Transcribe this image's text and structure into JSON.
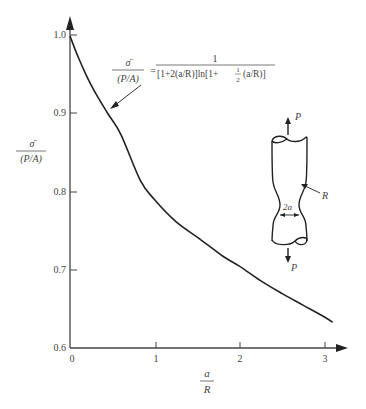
{
  "chart_data": {
    "type": "line",
    "title": "",
    "xlabel": "a/R",
    "ylabel": "σ̄/(P/A)",
    "xlim": [
      0,
      3.2
    ],
    "ylim": [
      0.6,
      1.05
    ],
    "grid": false,
    "x_ticks": [
      "0",
      "1",
      "2",
      "3"
    ],
    "y_ticks": [
      "0.6",
      "0.7",
      "0.8",
      "0.9",
      "1.0"
    ],
    "series": [
      {
        "name": "σ̄/(P/A)",
        "x": [
          0,
          0.1,
          0.2,
          0.3,
          0.45,
          0.6,
          0.83,
          1.0,
          1.25,
          1.53,
          1.8,
          2.0,
          2.24,
          2.5,
          2.75,
          3.0,
          3.1
        ],
        "y": [
          1.0,
          0.972,
          0.948,
          0.927,
          0.9,
          0.874,
          0.815,
          0.79,
          0.762,
          0.74,
          0.718,
          0.705,
          0.687,
          0.67,
          0.655,
          0.64,
          0.633
        ]
      }
    ],
    "annotations": {
      "formula_lhs_num": "σ̄",
      "formula_lhs_den": "(P/A)",
      "formula_eq": "=",
      "formula_rhs_num": "1",
      "formula_rhs_den_a": "[1+2(a/R)]ln[1+",
      "formula_rhs_frac_num": "1",
      "formula_rhs_frac_den": "2",
      "formula_rhs_den_b": "(a/R)]",
      "specimen_label_P_top": "P",
      "specimen_label_P_bottom": "P",
      "specimen_label_R": "R",
      "specimen_label_2a": "2a"
    }
  },
  "axis": {
    "y_label_num": "σ̄",
    "y_label_den": "(P/A)",
    "x_label_num": "a",
    "x_label_den": "R",
    "x_ticks": [
      "0",
      "1",
      "2",
      "3"
    ],
    "y_ticks": [
      "1.0",
      "0.9",
      "0.8",
      "0.7",
      "0.6"
    ]
  }
}
